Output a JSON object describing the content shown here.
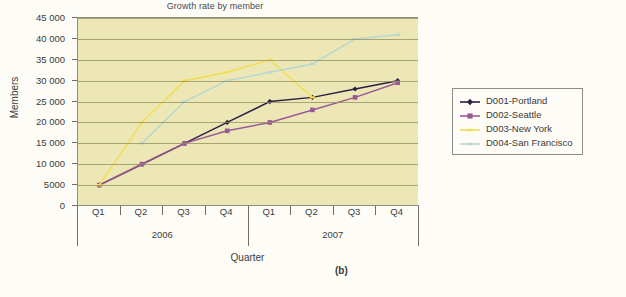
{
  "chart_data": {
    "type": "line",
    "title": "Growth rate by member",
    "xlabel": "Quarter",
    "ylabel": "Members",
    "ylim": [
      0,
      45000
    ],
    "ytick_step": 5000,
    "grid": true,
    "legend_position": "right",
    "categories": [
      "Q1",
      "Q2",
      "Q3",
      "Q4",
      "Q1",
      "Q2",
      "Q3",
      "Q4"
    ],
    "group_labels": [
      "2006",
      "2007"
    ],
    "ytick_labels": [
      "0",
      "5000",
      "10 000",
      "15 000",
      "20 000",
      "25 000",
      "30 000",
      "35 000",
      "40 000",
      "45 000"
    ],
    "ytick_values": [
      0,
      5000,
      10000,
      15000,
      20000,
      25000,
      30000,
      35000,
      40000,
      45000
    ],
    "series": [
      {
        "name": "D001-Portland",
        "color": "#2b1f46",
        "marker": "diamond",
        "values": [
          5000,
          10000,
          15000,
          20000,
          25000,
          26000,
          28000,
          30000
        ]
      },
      {
        "name": "D002-Seattle",
        "color": "#9a5a96",
        "marker": "square",
        "values": [
          5000,
          10000,
          15000,
          18000,
          20000,
          23000,
          26000,
          29500
        ]
      },
      {
        "name": "D003-New York",
        "color": "#f2dd55",
        "marker": "dash",
        "values": [
          5000,
          20000,
          30000,
          32000,
          35000,
          26000,
          null,
          null
        ]
      },
      {
        "name": "D004-San Francisco",
        "color": "#b9d6d2",
        "marker": "dash",
        "values": [
          null,
          15000,
          25000,
          30000,
          32000,
          34000,
          40000,
          41000
        ]
      }
    ]
  },
  "panel": {
    "letter": "(b)"
  },
  "caption": {
    "text": ""
  }
}
